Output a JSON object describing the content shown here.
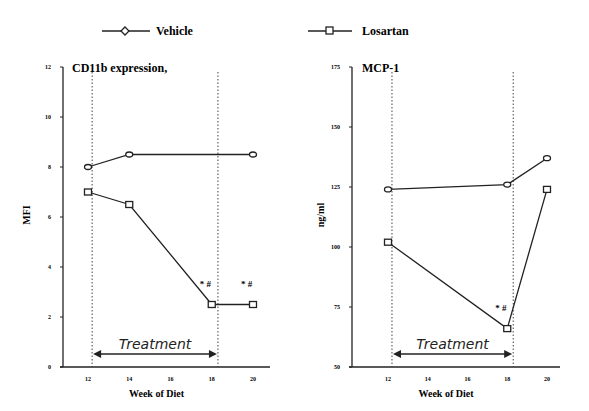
{
  "legend": [
    {
      "name": "Vehicle",
      "marker": "diamond-icon"
    },
    {
      "name": "Losartan",
      "marker": "square-icon"
    }
  ],
  "chart_data": [
    {
      "type": "line",
      "title": "CD11b expression,",
      "xlabel": "Week of Diet",
      "ylabel": "MFI",
      "x_ticks": [
        12,
        14,
        16,
        18,
        20
      ],
      "y_ticks": [
        0,
        2,
        4,
        6,
        8,
        10,
        12
      ],
      "ylim": [
        0,
        12
      ],
      "xlim": [
        11.5,
        21
      ],
      "treatment": {
        "label": "Treatment",
        "start": 12.2,
        "end": 18.3
      },
      "series": [
        {
          "name": "Vehicle",
          "x": [
            12,
            14,
            20
          ],
          "values": [
            8,
            8.5,
            8.5
          ]
        },
        {
          "name": "Losartan",
          "x": [
            12,
            14,
            18,
            20
          ],
          "values": [
            7,
            6.5,
            2.5,
            2.5
          ]
        }
      ],
      "annotations": [
        {
          "x": 18,
          "text": "* #"
        },
        {
          "x": 20,
          "text": "* #"
        }
      ]
    },
    {
      "type": "line",
      "title": "MCP-1",
      "xlabel": "Week of Diet",
      "ylabel": "ng/ml",
      "x_ticks": [
        12,
        14,
        16,
        18,
        20
      ],
      "y_ticks": [
        50,
        75,
        100,
        125,
        150,
        175
      ],
      "ylim": [
        50,
        175
      ],
      "xlim": [
        11.5,
        21
      ],
      "treatment": {
        "label": "Treatment",
        "start": 12.2,
        "end": 18.3
      },
      "series": [
        {
          "name": "Vehicle",
          "x": [
            12,
            18,
            20
          ],
          "values": [
            124,
            126,
            137
          ]
        },
        {
          "name": "Losartan",
          "x": [
            12,
            18,
            20
          ],
          "values": [
            102,
            66,
            124
          ]
        }
      ],
      "annotations": [
        {
          "x": 18,
          "text": "* #"
        }
      ]
    }
  ]
}
